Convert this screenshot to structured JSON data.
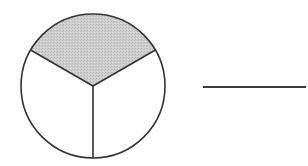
{
  "diagram": {
    "type": "fraction-circle",
    "circle": {
      "cx": 93,
      "cy": 86,
      "r": 72,
      "stroke": "#333333",
      "stroke_width": 1.6
    },
    "sectors": {
      "total": 3,
      "shaded": 1,
      "shaded_position": "top",
      "shade_color": "#c9c9c9",
      "unshaded_color": "#ffffff"
    },
    "fraction_represented": "1/3",
    "answer_line": {
      "visible": true,
      "text": ""
    }
  }
}
